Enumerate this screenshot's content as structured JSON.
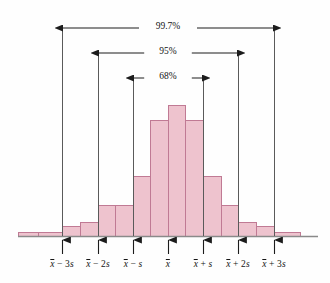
{
  "figure": {
    "type": "histogram-with-range-brackets",
    "background_color": "#fefefe",
    "bar_fill_color": "#eec3ce",
    "bar_stroke_color": "#c07a94",
    "axis_color": "#8a8a8a",
    "line_color": "#3a3a3a"
  },
  "brackets": [
    {
      "id": "three-sigma",
      "label": "99.7%",
      "from": "x-bar-minus-3s",
      "to": "x-bar-plus-3s",
      "y": 28,
      "x1": 62,
      "x2": 274
    },
    {
      "id": "two-sigma",
      "label": "95%",
      "from": "x-bar-minus-2s",
      "to": "x-bar-plus-2s",
      "y": 53,
      "x1": 98,
      "x2": 238
    },
    {
      "id": "one-sigma",
      "label": "68%",
      "from": "x-bar-minus-s",
      "to": "x-bar-plus-s",
      "y": 78,
      "x1": 133,
      "x2": 203
    }
  ],
  "axis_ticks": [
    {
      "id": "x-bar-minus-3s",
      "x": 62,
      "prefix": "",
      "base": "x",
      "suffix": " − 3s"
    },
    {
      "id": "x-bar-minus-2s",
      "x": 98,
      "prefix": "",
      "base": "x",
      "suffix": " − 2s"
    },
    {
      "id": "x-bar-minus-s",
      "x": 133,
      "prefix": "",
      "base": "x",
      "suffix": " − s"
    },
    {
      "id": "x-bar",
      "x": 168,
      "prefix": "",
      "base": "x",
      "suffix": ""
    },
    {
      "id": "x-bar-plus-s",
      "x": 203,
      "prefix": "",
      "base": "x",
      "suffix": " + s"
    },
    {
      "id": "x-bar-plus-2s",
      "x": 238,
      "prefix": "",
      "base": "x",
      "suffix": " + 2s"
    },
    {
      "id": "x-bar-plus-3s",
      "x": 274,
      "prefix": "",
      "base": "x",
      "suffix": " + 3s"
    }
  ],
  "chart_data": {
    "type": "bar",
    "title": "",
    "xlabel": "",
    "ylabel": "",
    "grid": false,
    "legend": null,
    "categories": [
      "< x̄ − 3.5s",
      "x̄ − 3.5s to x̄ − 3s",
      "x̄ − 3s to x̄ − 2.5s",
      "x̄ − 2.5s to x̄ − 2s",
      "x̄ − 2s to x̄ − 1.5s",
      "x̄ − 1.5s to x̄ − s",
      "x̄ − s to x̄ − 0.5s",
      "x̄ − 0.5s to x̄",
      "x̄ to x̄ + 0.5s",
      "x̄ + 0.5s to x̄ + s",
      "x̄ + s to x̄ + 1.5s",
      "x̄ + 1.5s to x̄ + 2s",
      "x̄ + 2s to x̄ + 2.5s",
      "x̄ + 2.5s to x̄ + 3s",
      "> x̄ + 3s"
    ],
    "values": [
      2,
      2,
      10,
      26,
      54,
      54,
      115,
      126,
      115,
      54,
      54,
      26,
      10,
      2,
      2
    ],
    "bars": [
      {
        "x0": 18,
        "x1": 38,
        "top": 232
      },
      {
        "x0": 38,
        "x1": 62,
        "top": 232
      },
      {
        "x0": 62,
        "x1": 80,
        "top": 226
      },
      {
        "x0": 80,
        "x1": 98,
        "top": 222
      },
      {
        "x0": 98,
        "x1": 115,
        "top": 205
      },
      {
        "x0": 115,
        "x1": 133,
        "top": 205
      },
      {
        "x0": 133,
        "x1": 150,
        "top": 176
      },
      {
        "x0": 150,
        "x1": 168,
        "top": 120
      },
      {
        "x0": 168,
        "x1": 185,
        "top": 105
      },
      {
        "x0": 185,
        "x1": 203,
        "top": 120
      },
      {
        "x0": 203,
        "x1": 221,
        "top": 176
      },
      {
        "x0": 221,
        "x1": 238,
        "top": 205
      },
      {
        "x0": 238,
        "x1": 256,
        "top": 222
      },
      {
        "x0": 256,
        "x1": 274,
        "top": 226
      },
      {
        "x0": 274,
        "x1": 300,
        "top": 232
      }
    ],
    "baseline_y": 236,
    "axis_x_start": 18,
    "axis_x_end": 318,
    "annotations": [
      "99.7%",
      "95%",
      "68%"
    ]
  }
}
